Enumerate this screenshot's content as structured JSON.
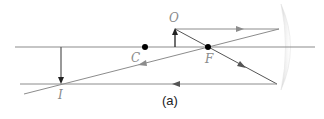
{
  "diagram": {
    "caption": "(a)",
    "labels": {
      "object": "O",
      "center": "C",
      "focus": "F",
      "image": "I"
    },
    "colors": {
      "axis": "#8c8c8c",
      "ray": "#8c8c8c",
      "arrow_object": "#222222",
      "point": "#000000",
      "mirror": "#e6e6e6",
      "label": "#8a8a8a"
    },
    "elements": {
      "principal_axis": "horizontal line",
      "mirror": "concave mirror",
      "points": [
        "C",
        "F"
      ],
      "object_arrow": "upright, at O",
      "image_arrow": "inverted, at I"
    }
  }
}
